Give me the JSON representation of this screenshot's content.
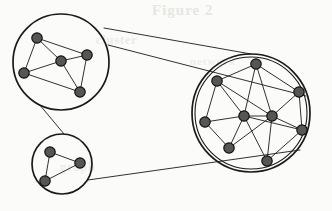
{
  "figure": {
    "background_color": "#fbfbf9",
    "stroke_color": "#1a1a1a",
    "node_fill_color": "#565656",
    "node_stroke_color": "#111111",
    "node_radius": 5.2,
    "edge_width": 0.9,
    "circle_width": 1.7,
    "connector_width": 0.9
  },
  "ghost_text": {
    "line1": "Figure 2",
    "line2": "cluster",
    "line3": "network",
    "line4": "graph"
  },
  "clusters": [
    {
      "id": "cluster-top-left",
      "label": "top-left cluster",
      "circle": {
        "cx": 61,
        "cy": 62,
        "r": 48
      },
      "nodes": [
        {
          "id": "tl-1",
          "x": 37,
          "y": 38
        },
        {
          "id": "tl-2",
          "x": 24,
          "y": 73
        },
        {
          "id": "tl-3",
          "x": 61,
          "y": 61
        },
        {
          "id": "tl-4",
          "x": 87,
          "y": 55
        },
        {
          "id": "tl-5",
          "x": 80,
          "y": 92
        }
      ],
      "edges": [
        [
          "tl-1",
          "tl-2"
        ],
        [
          "tl-1",
          "tl-3"
        ],
        [
          "tl-1",
          "tl-4"
        ],
        [
          "tl-2",
          "tl-3"
        ],
        [
          "tl-2",
          "tl-5"
        ],
        [
          "tl-3",
          "tl-4"
        ],
        [
          "tl-3",
          "tl-5"
        ],
        [
          "tl-4",
          "tl-5"
        ]
      ]
    },
    {
      "id": "cluster-bottom-left",
      "label": "bottom-left cluster",
      "circle": {
        "cx": 62,
        "cy": 164,
        "r": 30
      },
      "nodes": [
        {
          "id": "bl-1",
          "x": 50,
          "y": 152
        },
        {
          "id": "bl-2",
          "x": 80,
          "y": 163
        },
        {
          "id": "bl-3",
          "x": 45,
          "y": 181
        }
      ],
      "edges": [
        [
          "bl-1",
          "bl-2"
        ],
        [
          "bl-1",
          "bl-3"
        ],
        [
          "bl-2",
          "bl-3"
        ]
      ]
    },
    {
      "id": "cluster-right-large",
      "label": "large right cluster",
      "circle": {
        "cx": 251,
        "cy": 113,
        "r": 59
      },
      "inner_circle": {
        "cx": 251,
        "cy": 113,
        "r": 56
      },
      "nodes": [
        {
          "id": "r-1",
          "x": 256,
          "y": 64
        },
        {
          "id": "r-2",
          "x": 217,
          "y": 81
        },
        {
          "id": "r-3",
          "x": 299,
          "y": 92
        },
        {
          "id": "r-4",
          "x": 205,
          "y": 122
        },
        {
          "id": "r-5",
          "x": 244,
          "y": 116
        },
        {
          "id": "r-6",
          "x": 272,
          "y": 116
        },
        {
          "id": "r-7",
          "x": 302,
          "y": 130
        },
        {
          "id": "r-8",
          "x": 229,
          "y": 148
        },
        {
          "id": "r-9",
          "x": 267,
          "y": 161
        }
      ],
      "edges": [
        [
          "r-1",
          "r-2"
        ],
        [
          "r-1",
          "r-3"
        ],
        [
          "r-1",
          "r-5"
        ],
        [
          "r-1",
          "r-6"
        ],
        [
          "r-2",
          "r-4"
        ],
        [
          "r-2",
          "r-5"
        ],
        [
          "r-2",
          "r-6"
        ],
        [
          "r-3",
          "r-6"
        ],
        [
          "r-3",
          "r-7"
        ],
        [
          "r-4",
          "r-5"
        ],
        [
          "r-4",
          "r-8"
        ],
        [
          "r-5",
          "r-6"
        ],
        [
          "r-5",
          "r-7"
        ],
        [
          "r-5",
          "r-8"
        ],
        [
          "r-5",
          "r-9"
        ],
        [
          "r-6",
          "r-7"
        ],
        [
          "r-6",
          "r-8"
        ],
        [
          "r-6",
          "r-9"
        ],
        [
          "r-7",
          "r-9"
        ]
      ]
    }
  ],
  "connectors": [
    {
      "id": "connector-topleft-to-large-upper",
      "x1": 104,
      "y1": 28,
      "x2": 251,
      "y2": 54
    },
    {
      "id": "connector-topleft-to-large-lower",
      "x1": 108,
      "y1": 45,
      "x2": 306,
      "y2": 96
    },
    {
      "id": "connector-topleft-to-bottomleft",
      "x1": 39,
      "y1": 104,
      "x2": 64,
      "y2": 134
    },
    {
      "id": "connector-bottomleft-to-large",
      "x1": 88,
      "y1": 180,
      "x2": 300,
      "y2": 150
    }
  ]
}
